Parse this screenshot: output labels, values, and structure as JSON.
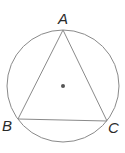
{
  "diagram": {
    "colors": {
      "stroke": "#8a8a8a",
      "center_dot": "#555555",
      "label": "#2a2a2a",
      "background": "#ffffff"
    },
    "circle": {
      "cx": 63,
      "cy": 86,
      "r": 56
    },
    "center_point": {
      "x": 63,
      "y": 86,
      "r": 2
    },
    "vertices": [
      {
        "name": "A",
        "x": 63,
        "y": 30,
        "label_x": 58,
        "label_y": 24
      },
      {
        "name": "B",
        "x": 18,
        "y": 119,
        "label_x": 2,
        "label_y": 131
      },
      {
        "name": "C",
        "x": 107,
        "y": 121,
        "label_x": 108,
        "label_y": 133
      }
    ],
    "segments": [
      "AB",
      "BC",
      "CA"
    ]
  }
}
